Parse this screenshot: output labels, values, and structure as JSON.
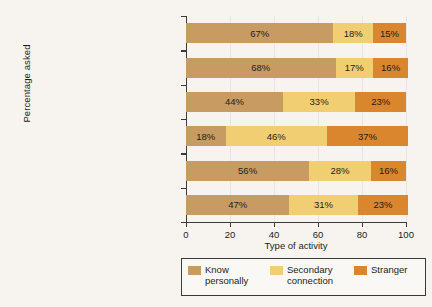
{
  "chart_data": {
    "type": "bar",
    "orientation": "horizontal",
    "stacked": true,
    "title": "",
    "xlabel": "Type of activity",
    "ylabel": "Percentage asked",
    "xlim": [
      0,
      100
    ],
    "xticks": [
      0,
      20,
      40,
      60,
      80,
      100
    ],
    "grid": true,
    "legend_position": "bottom",
    "categories": [
      "Participate in community activity",
      "Participate in protest",
      "Contact government officials",
      "Campaign contribution",
      "Campaign work",
      "All requests"
    ],
    "series": [
      {
        "name": "Know personally",
        "color": "#c89b62",
        "values": [
          67,
          68,
          44,
          18,
          56,
          47
        ],
        "labels": [
          "67%",
          "68%",
          "44%",
          "18%",
          "56%",
          "47%"
        ]
      },
      {
        "name": "Secondary connection",
        "color": "#f2ce72",
        "values": [
          18,
          17,
          33,
          46,
          28,
          31
        ],
        "labels": [
          "18%",
          "17%",
          "33%",
          "46%",
          "28%",
          "31%"
        ]
      },
      {
        "name": "Stranger",
        "color": "#d9862f",
        "values": [
          15,
          16,
          23,
          37,
          16,
          23
        ],
        "labels": [
          "15%",
          "16%",
          "23%",
          "37%",
          "16%",
          "23%"
        ]
      }
    ]
  }
}
